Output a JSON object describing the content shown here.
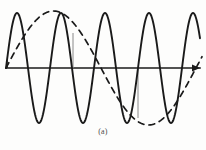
{
  "figure": {
    "caption": "(a)",
    "background_color": "#fdfdfc",
    "ink_color": "#1a1a1a",
    "guide_color": "#8a8a8a",
    "width": 206,
    "height": 150
  },
  "axis": {
    "name": "horizontal-time-axis",
    "y": 68,
    "x_start": 6,
    "x_end": 200,
    "has_arrowhead_right": true,
    "stroke_width": 1.6
  },
  "guides": [
    {
      "label": "guide-line-left",
      "x": 73,
      "y_top": 33,
      "y_bottom": 68
    },
    {
      "label": "guide-line-right",
      "x": 138,
      "y_top": 68,
      "y_bottom": 118
    }
  ],
  "chart_data": {
    "type": "line",
    "title": "(a)",
    "xlabel": "",
    "ylabel": "",
    "xlim": [
      0,
      206
    ],
    "ylim": [
      -60,
      60
    ],
    "grid": false,
    "legend": "none",
    "baseline_y": 68,
    "series": [
      {
        "name": "high-frequency-carrier",
        "style": "solid",
        "color": "#1a1a1a",
        "stroke_width": 1.9,
        "waveform": "sine",
        "amplitude": 55,
        "period": 44,
        "phase_deg": 0,
        "x_start": 6,
        "x_end": 200,
        "cycles": 4.4,
        "peaks_x": [
          22,
          66,
          110,
          154,
          198
        ],
        "troughs_x": [
          44,
          88,
          132,
          176
        ]
      },
      {
        "name": "low-frequency-modulating-wave",
        "style": "dashed",
        "color": "#1a1a1a",
        "stroke_width": 1.7,
        "dash_pattern": "6,5",
        "waveform": "sine",
        "amplitude": 57,
        "period": 190,
        "phase_deg": 0,
        "x_start": 6,
        "x_end": 202,
        "cycles": 1.03,
        "peaks_x": [
          48
        ],
        "troughs_x": [
          143
        ]
      }
    ]
  }
}
